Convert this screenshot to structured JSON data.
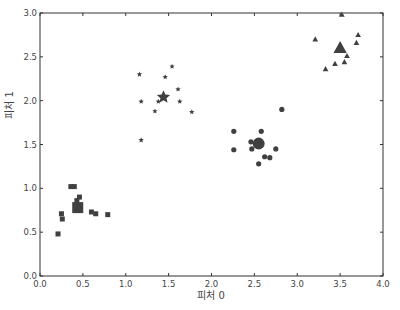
{
  "chart_data": {
    "type": "scatter",
    "title": "",
    "xlabel": "피처 0",
    "ylabel": "피처 1",
    "xlim": [
      0.0,
      4.0
    ],
    "ylim": [
      0.0,
      3.0
    ],
    "xticks": [
      "0.0",
      "0.5",
      "1.0",
      "1.5",
      "2.0",
      "2.5",
      "3.0",
      "3.5",
      "4.0"
    ],
    "yticks": [
      "0.0",
      "0.5",
      "1.0",
      "1.5",
      "2.0",
      "2.5",
      "3.0"
    ],
    "grid": false,
    "legend": null,
    "series": [
      {
        "name": "cluster-square",
        "marker": "square",
        "color": "#404040",
        "points": [
          [
            0.36,
            1.02
          ],
          [
            0.4,
            1.02
          ],
          [
            0.46,
            0.9
          ],
          [
            0.43,
            0.86
          ],
          [
            0.25,
            0.71
          ],
          [
            0.26,
            0.65
          ],
          [
            0.6,
            0.73
          ],
          [
            0.65,
            0.71
          ],
          [
            0.79,
            0.7
          ],
          [
            0.21,
            0.48
          ]
        ],
        "center": [
          0.44,
          0.78
        ]
      },
      {
        "name": "cluster-star",
        "marker": "star",
        "color": "#404040",
        "points": [
          [
            1.16,
            2.3
          ],
          [
            1.54,
            2.39
          ],
          [
            1.46,
            2.27
          ],
          [
            1.18,
            1.99
          ],
          [
            1.38,
            1.99
          ],
          [
            1.34,
            1.88
          ],
          [
            1.61,
            2.13
          ],
          [
            1.63,
            1.99
          ],
          [
            1.77,
            1.87
          ],
          [
            1.18,
            1.55
          ]
        ],
        "center": [
          1.44,
          2.04
        ]
      },
      {
        "name": "cluster-circle",
        "marker": "circle",
        "color": "#404040",
        "points": [
          [
            2.82,
            1.9
          ],
          [
            2.26,
            1.65
          ],
          [
            2.58,
            1.65
          ],
          [
            2.46,
            1.53
          ],
          [
            2.47,
            1.45
          ],
          [
            2.26,
            1.44
          ],
          [
            2.75,
            1.45
          ],
          [
            2.62,
            1.36
          ],
          [
            2.68,
            1.35
          ],
          [
            2.55,
            1.28
          ]
        ],
        "center": [
          2.55,
          1.51
        ]
      },
      {
        "name": "cluster-triangle",
        "marker": "triangle",
        "color": "#404040",
        "points": [
          [
            3.52,
            2.98
          ],
          [
            3.21,
            2.7
          ],
          [
            3.71,
            2.75
          ],
          [
            3.69,
            2.66
          ],
          [
            3.58,
            2.51
          ],
          [
            3.55,
            2.44
          ],
          [
            3.44,
            2.42
          ],
          [
            3.33,
            2.36
          ]
        ],
        "center": [
          3.5,
          2.6
        ]
      }
    ]
  }
}
